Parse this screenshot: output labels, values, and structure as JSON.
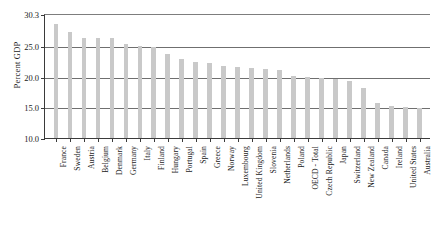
{
  "chart_data": {
    "type": "bar",
    "title": "",
    "xlabel": "",
    "ylabel": "Percent GDP",
    "ylim": [
      10.0,
      30.3
    ],
    "yticks": [
      10.0,
      15.0,
      20.0,
      25.0,
      30.3
    ],
    "ytick_labels": [
      "10.0",
      "15.0",
      "20.0",
      "25.0",
      "30.3"
    ],
    "gridlines": [
      15.0,
      20.0,
      25.0
    ],
    "grid": true,
    "legend": "none",
    "bar_color": "#c9c9c9",
    "categories": [
      "France",
      "Sweden",
      "Austria",
      "Belgium",
      "Denmark",
      "Germany",
      "Italy",
      "Finland",
      "Hungary",
      "Portugal",
      "Spain",
      "Greece",
      "Norway",
      "Luxembourg",
      "United Kingdom",
      "Slovenia",
      "Netherlands",
      "Poland",
      "OECD - Total",
      "Czech Republic",
      "Japan",
      "Switzerland",
      "New Zealand",
      "Canada",
      "Ireland",
      "United States",
      "Australia"
    ],
    "values": [
      28.6,
      27.4,
      26.4,
      26.4,
      26.3,
      25.4,
      25.0,
      24.9,
      23.7,
      23.0,
      22.5,
      22.3,
      21.8,
      21.6,
      21.5,
      21.3,
      21.1,
      20.2,
      20.0,
      19.9,
      19.7,
      19.4,
      18.2,
      15.7,
      15.3,
      15.1,
      14.9
    ]
  }
}
